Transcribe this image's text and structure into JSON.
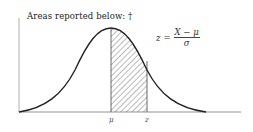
{
  "figure": {
    "title": "Areas reported below: †",
    "formula": {
      "lhs": "z",
      "equals": "=",
      "numerator": "X − μ",
      "denominator": "σ"
    },
    "labels": {
      "mu": "μ",
      "z": "z"
    },
    "shaded_region": "area between μ and z under standard normal curve",
    "colors": {
      "line": "#222222",
      "hatch": "#555555",
      "background": "#ffffff"
    }
  }
}
